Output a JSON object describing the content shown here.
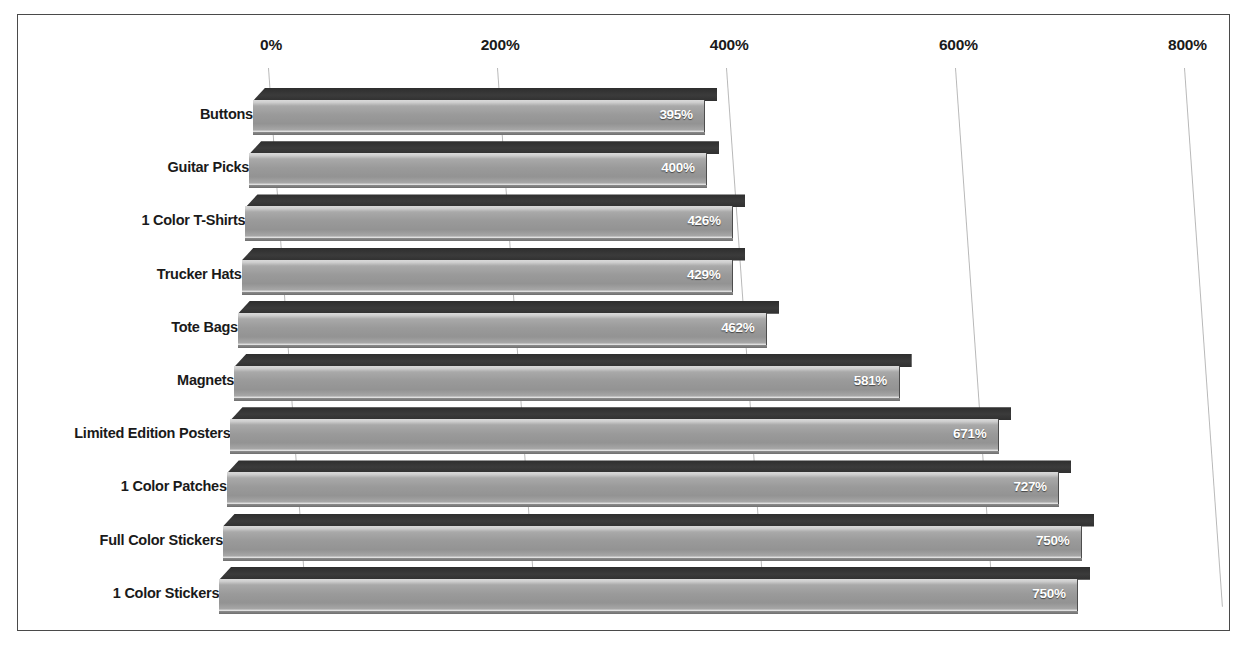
{
  "chart_data": {
    "type": "bar",
    "orientation": "horizontal",
    "title": "",
    "subtitle": "",
    "xlabel": "",
    "ylabel": "",
    "xlim": [
      0,
      800
    ],
    "grid": true,
    "legend": false,
    "value_suffix": "%",
    "tick_labels": [
      "0%",
      "200%",
      "400%",
      "600%",
      "800%"
    ],
    "ticks": [
      0,
      200,
      400,
      600,
      800
    ],
    "categories": [
      "Buttons",
      "Guitar Picks",
      "1 Color T-Shirts",
      "Trucker Hats",
      "Tote Bags",
      "Magnets",
      "Limited Edition Posters",
      "1 Color Patches",
      "Full Color Stickers",
      "1 Color Stickers"
    ],
    "values": [
      395,
      400,
      426,
      429,
      462,
      581,
      671,
      727,
      750,
      750
    ],
    "data_labels": [
      "395%",
      "400%",
      "426%",
      "429%",
      "462%",
      "581%",
      "671%",
      "727%",
      "750%",
      "750%"
    ],
    "series": [
      {
        "name": "Markup",
        "values": [
          395,
          400,
          426,
          429,
          462,
          581,
          671,
          727,
          750,
          750
        ]
      }
    ]
  },
  "style": {
    "bar_face_color": "#9a9a9a",
    "bar_top_color": "#333333",
    "gridline_color": "#b9b9b9",
    "frame_color": "#4a4a4a",
    "background_color": "#ffffff",
    "label_color": "#1a1a1a",
    "value_label_color": "#ffffff"
  }
}
